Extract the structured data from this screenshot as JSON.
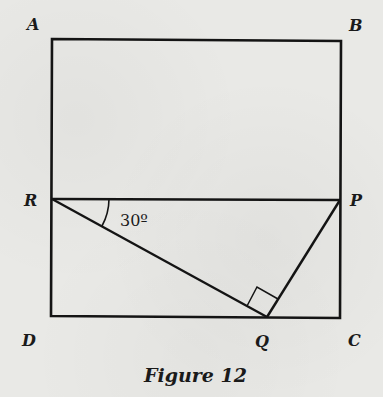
{
  "figure": {
    "caption": "Figure 12",
    "shape": "rectangle ABCD with segments RP, RQ, PQ",
    "points": {
      "A": {
        "label": "A",
        "x": 52,
        "y": 39
      },
      "B": {
        "label": "B",
        "x": 341,
        "y": 41
      },
      "C": {
        "label": "C",
        "x": 340,
        "y": 318
      },
      "D": {
        "label": "D",
        "x": 51,
        "y": 316
      },
      "R": {
        "label": "R",
        "x": 52,
        "y": 199
      },
      "P": {
        "label": "P",
        "x": 340,
        "y": 200
      },
      "Q": {
        "label": "Q",
        "x": 267,
        "y": 317
      }
    },
    "segments": [
      {
        "from": "A",
        "to": "B"
      },
      {
        "from": "B",
        "to": "C"
      },
      {
        "from": "C",
        "to": "D"
      },
      {
        "from": "D",
        "to": "A"
      },
      {
        "from": "R",
        "to": "P"
      },
      {
        "from": "R",
        "to": "Q"
      },
      {
        "from": "P",
        "to": "Q"
      }
    ],
    "angles": [
      {
        "vertex": "R",
        "between": [
          "P",
          "Q"
        ],
        "label": "30º",
        "type": "arc"
      },
      {
        "vertex": "Q",
        "between": [
          "R",
          "P"
        ],
        "label": "",
        "type": "right-angle"
      }
    ],
    "colors": {
      "line": "#141414",
      "background": "#e9e9e6"
    }
  }
}
